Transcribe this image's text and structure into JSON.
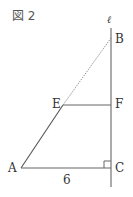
{
  "figure": {
    "title": "図 2",
    "line_label": "ℓ",
    "points": {
      "A": "A",
      "B": "B",
      "C": "C",
      "E": "E",
      "F": "F"
    },
    "segment_AC_length": "6",
    "colors": {
      "line": "#555555",
      "text": "#333333"
    }
  }
}
